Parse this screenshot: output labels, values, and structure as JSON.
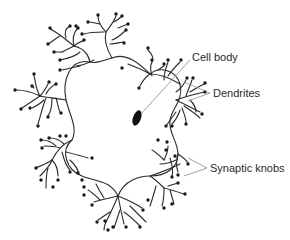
{
  "diagram": {
    "labels": {
      "cell_body": "Cell body",
      "dendrites": "Dendrites",
      "synaptic_knobs": "Synaptic knobs"
    },
    "colors": {
      "line": "#2b2b2b",
      "knob": "#1a1a1a",
      "nucleus": "#111111",
      "leader": "#8a8a8a"
    }
  }
}
